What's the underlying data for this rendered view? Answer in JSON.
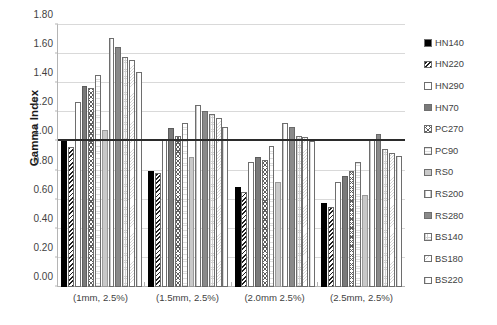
{
  "chart_data": {
    "type": "bar",
    "title": "",
    "xlabel": "",
    "ylabel": "Gamma Index",
    "ylim": [
      0.0,
      1.8
    ],
    "ytick_step": 0.2,
    "ytick_labels": [
      "1.80",
      "1.60",
      "1.40",
      "1.20",
      "1.00",
      "0.80",
      "0.60",
      "0.40",
      "0.20",
      "0.00"
    ],
    "ytick_values": [
      1.8,
      1.6,
      1.4,
      1.2,
      1.0,
      0.8,
      0.6,
      0.4,
      0.2,
      0.0
    ],
    "grid": true,
    "legend_position": "right",
    "reference_line": {
      "value": 1.0,
      "color": "#2b2b2b"
    },
    "categories": [
      "(1mm, 2.5%)",
      "(1.5mm, 2.5%)",
      "(2.0mm 2.5%)",
      "(2.5mm, 2.5%)"
    ],
    "series": [
      {
        "name": "HN140",
        "fill": "solid-black",
        "values": [
          1.02,
          0.8,
          0.69,
          0.58
        ]
      },
      {
        "name": "HN220",
        "fill": "diag-dark",
        "values": [
          0.96,
          0.78,
          0.65,
          0.55
        ]
      },
      {
        "name": "HN290",
        "fill": "white",
        "values": [
          1.27,
          1.01,
          0.86,
          0.72
        ]
      },
      {
        "name": "HN70",
        "fill": "solid-gray",
        "values": [
          1.38,
          1.09,
          0.89,
          0.76
        ]
      },
      {
        "name": "PC270",
        "fill": "cross",
        "values": [
          1.37,
          1.04,
          0.87,
          0.8
        ]
      },
      {
        "name": "PC90",
        "fill": "dot-light",
        "values": [
          1.46,
          1.13,
          0.97,
          0.86
        ]
      },
      {
        "name": "RS0",
        "fill": "light-gray",
        "values": [
          1.08,
          0.89,
          0.72,
          0.63
        ]
      },
      {
        "name": "RS200",
        "fill": "vert-light",
        "values": [
          1.71,
          1.25,
          1.13,
          1.01
        ]
      },
      {
        "name": "RS280",
        "fill": "mid-gray",
        "values": [
          1.65,
          1.21,
          1.1,
          1.05
        ]
      },
      {
        "name": "BS140",
        "fill": "grid-fine",
        "values": [
          1.58,
          1.19,
          1.04,
          0.95
        ]
      },
      {
        "name": "BS180",
        "fill": "speck",
        "values": [
          1.56,
          1.16,
          1.03,
          0.92
        ]
      },
      {
        "name": "BS220",
        "fill": "plain-light",
        "values": [
          1.48,
          1.1,
          1.0,
          0.9
        ]
      }
    ]
  },
  "legend": {
    "items": [
      {
        "label": "HN140",
        "fill": "solid-black"
      },
      {
        "label": "HN220",
        "fill": "diag-dark"
      },
      {
        "label": "HN290",
        "fill": "white"
      },
      {
        "label": "HN70",
        "fill": "solid-gray"
      },
      {
        "label": "PC270",
        "fill": "cross"
      },
      {
        "label": "PC90",
        "fill": "dot-light"
      },
      {
        "label": "RS0",
        "fill": "light-gray"
      },
      {
        "label": "RS200",
        "fill": "vert-light"
      },
      {
        "label": "RS280",
        "fill": "mid-gray"
      },
      {
        "label": "BS140",
        "fill": "grid-fine"
      },
      {
        "label": "BS180",
        "fill": "speck"
      },
      {
        "label": "BS220",
        "fill": "plain-light"
      }
    ]
  },
  "colors": {
    "gridline": "#d9d9d9",
    "axis": "#b5b5b5",
    "reference_line": "#2b2b2b",
    "text": "#3f3f3f",
    "background": "#ffffff"
  }
}
